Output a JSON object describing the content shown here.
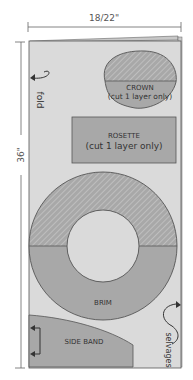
{
  "dimensions": {
    "width_label": "18/22\"",
    "height_label": "36\""
  },
  "annotations": {
    "fold": "fold",
    "selvages": "selvages"
  },
  "pieces": {
    "crown": {
      "label": "CROWN",
      "sublabel": "(cut 1 layer only)"
    },
    "rosette": {
      "label": "ROSETTE",
      "sublabel": "(cut 1 layer only)"
    },
    "brim": {
      "label": "BRIM"
    },
    "side_band": {
      "label": "SIDE BAND"
    }
  },
  "colors": {
    "fabric": "#dadada",
    "piece": "#a8a8a8",
    "hatch": "#c4c4c4",
    "outline": "#555555",
    "dimension_line": "#666666"
  }
}
